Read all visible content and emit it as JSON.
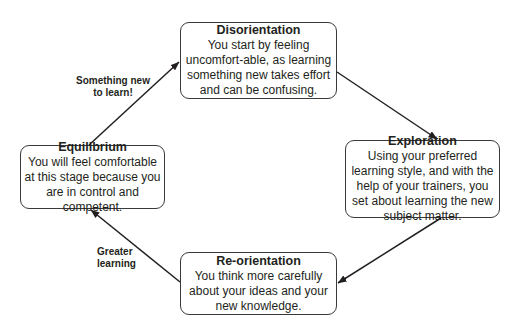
{
  "diagram": {
    "type": "cycle",
    "line_color": "#231f20",
    "box_border_color": "#3a3a3a",
    "stages": [
      {
        "id": "disorientation",
        "title": "Disorientation",
        "description": "You start by feeling uncomfort-able, as learning something new takes effort and can be confusing."
      },
      {
        "id": "exploration",
        "title": "Exploration",
        "description": "Using your preferred learning style, and with the help of your trainers, you set about learning the new subject matter."
      },
      {
        "id": "reorientation",
        "title": "Re-orientation",
        "description": "You think more carefully about your ideas and your new knowledge."
      },
      {
        "id": "equilibrium",
        "title": "Equilibrium",
        "description": "You will feel comfortable at this stage because you are in control and competent."
      }
    ],
    "edges": [
      {
        "from": "disorientation",
        "to": "exploration",
        "label": ""
      },
      {
        "from": "exploration",
        "to": "reorientation",
        "label": ""
      },
      {
        "from": "reorientation",
        "to": "equilibrium",
        "label": "Greater learning"
      },
      {
        "from": "equilibrium",
        "to": "disorientation",
        "label": "Something new to learn!"
      }
    ],
    "edge_labels": {
      "something_new_line1": "Something new",
      "something_new_line2": "to learn!",
      "greater_learning_line1": "Greater",
      "greater_learning_line2": "learning"
    }
  }
}
